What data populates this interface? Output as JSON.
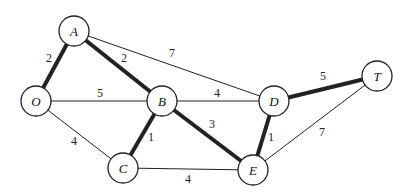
{
  "diagram": {
    "type": "weighted-undirected-graph",
    "colors": {
      "line": "#222222",
      "node_fill": "#ffffff",
      "background": "#ffffff"
    },
    "node_radius": 15,
    "nodes": [
      {
        "id": "A",
        "label": "A",
        "x": 74,
        "y": 31
      },
      {
        "id": "O",
        "label": "O",
        "x": 36,
        "y": 101
      },
      {
        "id": "B",
        "label": "B",
        "x": 162,
        "y": 101
      },
      {
        "id": "C",
        "label": "C",
        "x": 123,
        "y": 168
      },
      {
        "id": "D",
        "label": "D",
        "x": 274,
        "y": 101
      },
      {
        "id": "E",
        "label": "E",
        "x": 253,
        "y": 170
      },
      {
        "id": "T",
        "label": "T",
        "x": 377,
        "y": 76
      }
    ],
    "edges": [
      {
        "from": "O",
        "to": "A",
        "weight": "2",
        "bold": true,
        "lx": 49,
        "ly": 62
      },
      {
        "from": "A",
        "to": "B",
        "weight": "2",
        "bold": true,
        "lx": 124,
        "ly": 62
      },
      {
        "from": "A",
        "to": "D",
        "weight": "7",
        "bold": false,
        "lx": 172,
        "ly": 57
      },
      {
        "from": "O",
        "to": "B",
        "weight": "5",
        "bold": false,
        "lx": 100,
        "ly": 97
      },
      {
        "from": "O",
        "to": "C",
        "weight": "4",
        "bold": false,
        "lx": 74,
        "ly": 145
      },
      {
        "from": "B",
        "to": "C",
        "weight": "1",
        "bold": true,
        "lx": 151,
        "ly": 141
      },
      {
        "from": "B",
        "to": "D",
        "weight": "4",
        "bold": false,
        "lx": 217,
        "ly": 97
      },
      {
        "from": "B",
        "to": "E",
        "weight": "3",
        "bold": true,
        "lx": 212,
        "ly": 128
      },
      {
        "from": "C",
        "to": "E",
        "weight": "4",
        "bold": false,
        "lx": 188,
        "ly": 183
      },
      {
        "from": "D",
        "to": "E",
        "weight": "1",
        "bold": true,
        "lx": 271,
        "ly": 141
      },
      {
        "from": "D",
        "to": "T",
        "weight": "5",
        "bold": true,
        "lx": 323,
        "ly": 80
      },
      {
        "from": "E",
        "to": "T",
        "weight": "7",
        "bold": false,
        "lx": 322,
        "ly": 136
      }
    ]
  }
}
